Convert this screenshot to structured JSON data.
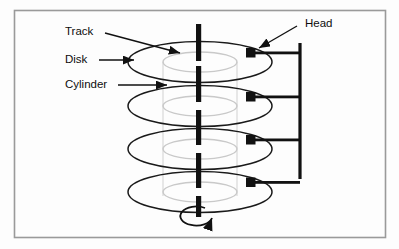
{
  "figure": {
    "background_color": "#fdfdfd",
    "border_color": "#9a9a9a",
    "ink_color": "#111111",
    "track_color": "#c9c9c9",
    "cylinder_color": "#dcdcdc"
  },
  "labels": {
    "track": "Track",
    "disk": "Disk",
    "cylinder": "Cylinder",
    "head": "Head"
  },
  "diagram": {
    "platter_count": 4,
    "head_count": 4,
    "spindle_label": "spindle",
    "rotation_label": "rotation"
  }
}
